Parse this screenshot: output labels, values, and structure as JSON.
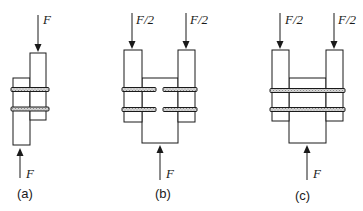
{
  "figures": [
    {
      "id": "a",
      "caption": "(a)",
      "type": "single-lap joint",
      "forces": [
        {
          "label": "F",
          "direction": "down",
          "position": "top"
        },
        {
          "label": "F",
          "direction": "up",
          "position": "bottom"
        }
      ],
      "bolts": 2,
      "plates": 2
    },
    {
      "id": "b",
      "caption": "(b)",
      "type": "double-lap joint, split bolts",
      "forces": [
        {
          "label": "F/2",
          "direction": "down",
          "position": "top-left"
        },
        {
          "label": "F/2",
          "direction": "down",
          "position": "top-right"
        },
        {
          "label": "F",
          "direction": "up",
          "position": "bottom"
        }
      ],
      "bolts": 4,
      "plates": 3
    },
    {
      "id": "c",
      "caption": "(c)",
      "type": "double-lap joint, through bolts",
      "forces": [
        {
          "label": "F/2",
          "direction": "down",
          "position": "top-left"
        },
        {
          "label": "F/2",
          "direction": "down",
          "position": "top-right"
        },
        {
          "label": "F",
          "direction": "up",
          "position": "bottom"
        }
      ],
      "bolts": 2,
      "plates": 3
    }
  ],
  "colors": {
    "line": "#1a1a1a",
    "background": "#ffffff",
    "bolt_fill": "#bdbdbd"
  }
}
